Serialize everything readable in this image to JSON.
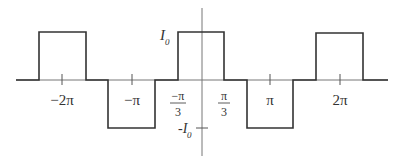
{
  "diagram": {
    "colors": {
      "line": "#333333",
      "axis": "#555555",
      "background": "#ffffff"
    },
    "y_axis": {
      "top_label": "I",
      "top_label_sub": "0",
      "bottom_label": "-I",
      "bottom_label_sub": "0"
    },
    "x_ticks": [
      {
        "label": "−2π"
      },
      {
        "label": "−π"
      },
      {
        "label_num": "−π",
        "label_den": "3"
      },
      {
        "label_num": "π",
        "label_den": "3"
      },
      {
        "label": "π"
      },
      {
        "label": "2π"
      }
    ],
    "pulses": [
      {
        "sign": "+",
        "from": "-7π/3",
        "to": "-5π/3"
      },
      {
        "sign": "-",
        "from": "-4π/3",
        "to": "-2π/3"
      },
      {
        "sign": "+",
        "from": "-π/3",
        "to": "π/3"
      },
      {
        "sign": "-",
        "from": "2π/3",
        "to": "4π/3"
      },
      {
        "sign": "+",
        "from": "5π/3",
        "to": "7π/3"
      }
    ]
  }
}
